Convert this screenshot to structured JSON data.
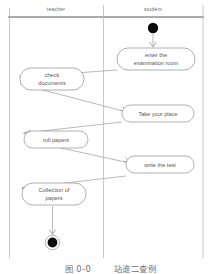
{
  "diagram": {
    "type": "uml-activity-diagram",
    "lanes": [
      {
        "id": "teacher",
        "title": "teacher"
      },
      {
        "id": "student",
        "title": "student"
      }
    ],
    "nodes": [
      {
        "id": "start",
        "kind": "initial-node",
        "lane": "student",
        "label": ""
      },
      {
        "id": "enter-exam-room",
        "kind": "activity",
        "lane": "student",
        "label_line1": "enter the",
        "label_line2": "examination room"
      },
      {
        "id": "check-documents",
        "kind": "activity",
        "lane": "teacher",
        "label_line1": "check",
        "label_line2": "documents"
      },
      {
        "id": "take-your-place",
        "kind": "activity",
        "lane": "student",
        "label_line1": "Take your place",
        "label_line2": ""
      },
      {
        "id": "roll-papers",
        "kind": "activity",
        "lane": "teacher",
        "label_line1": "roll papers",
        "label_line2": ""
      },
      {
        "id": "write-the-test",
        "kind": "activity",
        "lane": "student",
        "label_line1": "write the test",
        "label_line2": ""
      },
      {
        "id": "collection-of-papers",
        "kind": "activity",
        "lane": "teacher",
        "label_line1": "Collection of",
        "label_line2": "papers"
      },
      {
        "id": "end",
        "kind": "final-node",
        "lane": "teacher",
        "label": ""
      }
    ],
    "caption": {
      "figure_label": "图 0-0",
      "figure_title": "站谁二查例"
    }
  }
}
